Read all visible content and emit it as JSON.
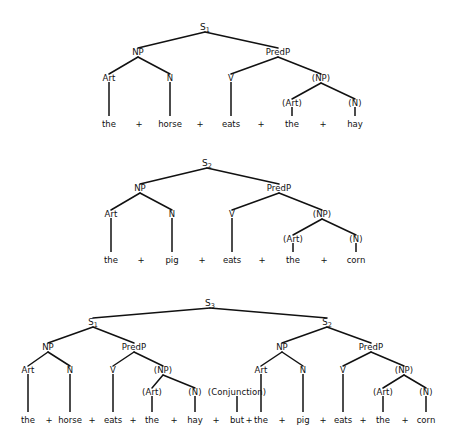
{
  "figure": {
    "background_color": "#ffffff",
    "line_color": "#111111",
    "text_color": "#111111",
    "conjunction_symbol": "+"
  },
  "trees": [
    {
      "id": "tree-1",
      "root_label": "S",
      "root_subscript": "1",
      "sentence": "the horse eats the hay",
      "nodes": [
        {
          "name": "root",
          "label": "S",
          "sub": "1",
          "x": 205,
          "y": 27
        },
        {
          "name": "np",
          "label": "NP",
          "sub": "",
          "x": 138,
          "y": 52
        },
        {
          "name": "predp",
          "label": "PredP",
          "sub": "",
          "x": 278,
          "y": 52
        },
        {
          "name": "art",
          "label": "Art",
          "sub": "",
          "x": 109,
          "y": 78
        },
        {
          "name": "n",
          "label": "N",
          "sub": "",
          "x": 170,
          "y": 78
        },
        {
          "name": "v",
          "label": "V",
          "sub": "",
          "x": 231,
          "y": 78
        },
        {
          "name": "np2",
          "label": "(NP)",
          "sub": "",
          "x": 321,
          "y": 78
        },
        {
          "name": "art2",
          "label": "(Art)",
          "sub": "",
          "x": 292,
          "y": 103
        },
        {
          "name": "n2",
          "label": "(N)",
          "sub": "",
          "x": 355,
          "y": 103
        }
      ],
      "edges": [
        {
          "from": "root",
          "to": "np"
        },
        {
          "from": "root",
          "to": "predp"
        },
        {
          "from": "np",
          "to": "art"
        },
        {
          "from": "np",
          "to": "n"
        },
        {
          "from": "predp",
          "to": "v"
        },
        {
          "from": "predp",
          "to": "np2"
        },
        {
          "from": "np2",
          "to": "art2"
        },
        {
          "from": "np2",
          "to": "n2"
        }
      ],
      "leaves": [
        {
          "word": "the",
          "x": 109,
          "stem_from": 82
        },
        {
          "word": "horse",
          "x": 170,
          "stem_from": 82
        },
        {
          "word": "eats",
          "x": 231,
          "stem_from": 82
        },
        {
          "word": "the",
          "x": 292,
          "stem_from": 107
        },
        {
          "word": "hay",
          "x": 355,
          "stem_from": 107
        }
      ],
      "plus_x": [
        139,
        200,
        261,
        323
      ],
      "baseline_y": 124
    },
    {
      "id": "tree-2",
      "root_label": "S",
      "root_subscript": "2",
      "sentence": "the pig eats the corn",
      "nodes": [
        {
          "name": "root",
          "label": "S",
          "sub": "2",
          "x": 207,
          "y": 163
        },
        {
          "name": "np",
          "label": "NP",
          "sub": "",
          "x": 140,
          "y": 188
        },
        {
          "name": "predp",
          "label": "PredP",
          "sub": "",
          "x": 279,
          "y": 188
        },
        {
          "name": "art",
          "label": "Art",
          "sub": "",
          "x": 111,
          "y": 214
        },
        {
          "name": "n",
          "label": "N",
          "sub": "",
          "x": 172,
          "y": 214
        },
        {
          "name": "v",
          "label": "V",
          "sub": "",
          "x": 232,
          "y": 214
        },
        {
          "name": "np2",
          "label": "(NP)",
          "sub": "",
          "x": 322,
          "y": 214
        },
        {
          "name": "art2",
          "label": "(Art)",
          "sub": "",
          "x": 293,
          "y": 239
        },
        {
          "name": "n2",
          "label": "(N)",
          "sub": "",
          "x": 356,
          "y": 239
        }
      ],
      "edges": [
        {
          "from": "root",
          "to": "np"
        },
        {
          "from": "root",
          "to": "predp"
        },
        {
          "from": "np",
          "to": "art"
        },
        {
          "from": "np",
          "to": "n"
        },
        {
          "from": "predp",
          "to": "v"
        },
        {
          "from": "predp",
          "to": "np2"
        },
        {
          "from": "np2",
          "to": "art2"
        },
        {
          "from": "np2",
          "to": "n2"
        }
      ],
      "leaves": [
        {
          "word": "the",
          "x": 111,
          "stem_from": 218
        },
        {
          "word": "pig",
          "x": 172,
          "stem_from": 218
        },
        {
          "word": "eats",
          "x": 232,
          "stem_from": 218
        },
        {
          "word": "the",
          "x": 293,
          "stem_from": 243
        },
        {
          "word": "corn",
          "x": 356,
          "stem_from": 243
        }
      ],
      "plus_x": [
        141,
        202,
        262,
        324
      ],
      "baseline_y": 260
    },
    {
      "id": "tree-3",
      "root_label": "S",
      "root_subscript": "3",
      "sentence": "the horse eats the hay but the pig eats the corn",
      "nodes": [
        {
          "name": "root",
          "label": "S",
          "sub": "3",
          "x": 210,
          "y": 303
        },
        {
          "name": "s1",
          "label": "S",
          "sub": "1",
          "x": 93,
          "y": 322
        },
        {
          "name": "s2",
          "label": "S",
          "sub": "2",
          "x": 327,
          "y": 322
        },
        {
          "name": "np-a",
          "label": "NP",
          "sub": "",
          "x": 48,
          "y": 347
        },
        {
          "name": "predp-a",
          "label": "PredP",
          "sub": "",
          "x": 134,
          "y": 347
        },
        {
          "name": "art-a",
          "label": "Art",
          "sub": "",
          "x": 28,
          "y": 370
        },
        {
          "name": "n-a",
          "label": "N",
          "sub": "",
          "x": 70,
          "y": 370
        },
        {
          "name": "v-a",
          "label": "V",
          "sub": "",
          "x": 113,
          "y": 370
        },
        {
          "name": "np2-a",
          "label": "(NP)",
          "sub": "",
          "x": 163,
          "y": 370
        },
        {
          "name": "art2-a",
          "label": "(Art)",
          "sub": "",
          "x": 152,
          "y": 392
        },
        {
          "name": "n2-a",
          "label": "(N)",
          "sub": "",
          "x": 195,
          "y": 392
        },
        {
          "name": "conj",
          "label": "(Conjunction)",
          "sub": "",
          "x": 237,
          "y": 392
        },
        {
          "name": "np-b",
          "label": "NP",
          "sub": "",
          "x": 282,
          "y": 347
        },
        {
          "name": "predp-b",
          "label": "PredP",
          "sub": "",
          "x": 371,
          "y": 347
        },
        {
          "name": "art-b",
          "label": "Art",
          "sub": "",
          "x": 261,
          "y": 370
        },
        {
          "name": "n-b",
          "label": "N",
          "sub": "",
          "x": 303,
          "y": 370
        },
        {
          "name": "v-b",
          "label": "V",
          "sub": "",
          "x": 343,
          "y": 370
        },
        {
          "name": "np2-b",
          "label": "(NP)",
          "sub": "",
          "x": 404,
          "y": 370
        },
        {
          "name": "art2-b",
          "label": "(Art)",
          "sub": "",
          "x": 383,
          "y": 392
        },
        {
          "name": "n2-b",
          "label": "(N)",
          "sub": "",
          "x": 426,
          "y": 392
        }
      ],
      "edges": [
        {
          "from": "root",
          "to": "s1"
        },
        {
          "from": "root",
          "to": "s2"
        },
        {
          "from": "s1",
          "to": "np-a"
        },
        {
          "from": "s1",
          "to": "predp-a"
        },
        {
          "from": "np-a",
          "to": "art-a"
        },
        {
          "from": "np-a",
          "to": "n-a"
        },
        {
          "from": "predp-a",
          "to": "v-a"
        },
        {
          "from": "predp-a",
          "to": "np2-a"
        },
        {
          "from": "np2-a",
          "to": "art2-a"
        },
        {
          "from": "np2-a",
          "to": "n2-a"
        },
        {
          "from": "s2",
          "to": "np-b"
        },
        {
          "from": "s2",
          "to": "predp-b"
        },
        {
          "from": "np-b",
          "to": "art-b"
        },
        {
          "from": "np-b",
          "to": "n-b"
        },
        {
          "from": "predp-b",
          "to": "v-b"
        },
        {
          "from": "predp-b",
          "to": "np2-b"
        },
        {
          "from": "np2-b",
          "to": "art2-b"
        },
        {
          "from": "np2-b",
          "to": "n2-b"
        }
      ],
      "leaves": [
        {
          "word": "the",
          "x": 28,
          "stem_from": 374
        },
        {
          "word": "horse",
          "x": 70,
          "stem_from": 374
        },
        {
          "word": "eats",
          "x": 113,
          "stem_from": 374
        },
        {
          "word": "the",
          "x": 152,
          "stem_from": 396
        },
        {
          "word": "hay",
          "x": 195,
          "stem_from": 396
        },
        {
          "word": "but",
          "x": 237,
          "stem_from": 396
        },
        {
          "word": "the",
          "x": 261,
          "stem_from": 374
        },
        {
          "word": "pig",
          "x": 303,
          "stem_from": 374
        },
        {
          "word": "eats",
          "x": 343,
          "stem_from": 374
        },
        {
          "word": "the",
          "x": 383,
          "stem_from": 396
        },
        {
          "word": "corn",
          "x": 426,
          "stem_from": 396
        }
      ],
      "plus_x": [
        49,
        92,
        133,
        174,
        216,
        249,
        282,
        323,
        363,
        405
      ],
      "baseline_y": 420
    }
  ]
}
